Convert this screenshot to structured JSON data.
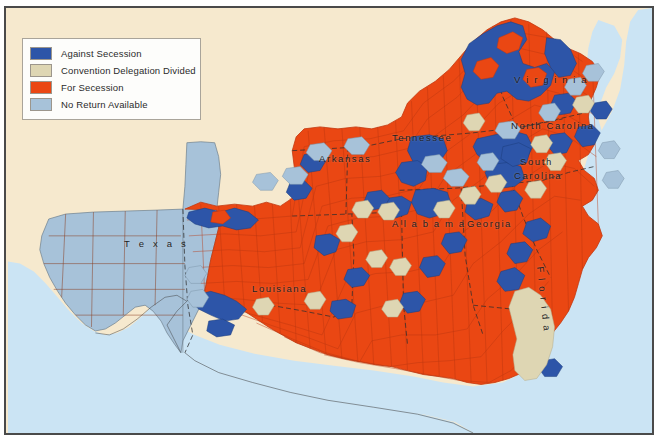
{
  "figure": {
    "frame_border_color": "#4a4a4a",
    "land_background_color": "#f6e9ce",
    "ocean_color": "#cbe4f4",
    "county_line_color": "#8a3a1c",
    "state_line_color": "#3a3a3a"
  },
  "legend": {
    "background_color": "#fdfdfb",
    "border_color": "#a9a49a",
    "items": [
      {
        "label": "Against Secession",
        "color": "#2d55a8"
      },
      {
        "label": "Convention Delegation Divided",
        "color": "#ded6b3"
      },
      {
        "label": "For Secession",
        "color": "#ea4713"
      },
      {
        "label": "No Return Available",
        "color": "#a7c2d9"
      }
    ]
  },
  "state_labels": [
    {
      "name": "Texas",
      "text": "T e x a s"
    },
    {
      "name": "Arkansas",
      "text": "Arkansas"
    },
    {
      "name": "Louisiana",
      "text": "Louisiana"
    },
    {
      "name": "Tennessee",
      "text": "Tennessee"
    },
    {
      "name": "Alabama",
      "text": "A l a b a m a"
    },
    {
      "name": "Georgia",
      "text": "Georgia"
    },
    {
      "name": "Florida",
      "text": "F l o r i d a"
    },
    {
      "name": "Virginia",
      "text": "V i r g i n i a"
    },
    {
      "name": "NorthCarolina",
      "text": "North Carolina"
    },
    {
      "name": "SouthCarolinaA",
      "text": "South"
    },
    {
      "name": "SouthCarolinaB",
      "text": "Carolina"
    }
  ],
  "map_data": {
    "type": "choropleth-map",
    "subject": "County-level vote on secession, 1860-1861",
    "categories": [
      "Against Secession",
      "Convention Delegation Divided",
      "For Secession",
      "No Return Available"
    ],
    "states_shown": [
      "Texas",
      "Arkansas",
      "Louisiana",
      "Mississippi",
      "Tennessee",
      "Alabama",
      "Georgia",
      "Florida",
      "South Carolina",
      "North Carolina",
      "Virginia"
    ],
    "dominant_category_by_state": {
      "Texas": "No Return Available",
      "Arkansas": "For Secession",
      "Louisiana": "For Secession",
      "Mississippi": "For Secession",
      "Tennessee": "For Secession",
      "Alabama": "For Secession",
      "Georgia": "For Secession",
      "Florida": "For Secession",
      "South Carolina": "For Secession",
      "North Carolina": "For Secession",
      "Virginia": "For Secession"
    },
    "notable_against_secession_regions": [
      "Northwestern Virginia (later West Virginia)",
      "Eastern Tennessee",
      "Northern Alabama hill country",
      "Central Texas German counties",
      "Northern Georgia mountains"
    ]
  }
}
